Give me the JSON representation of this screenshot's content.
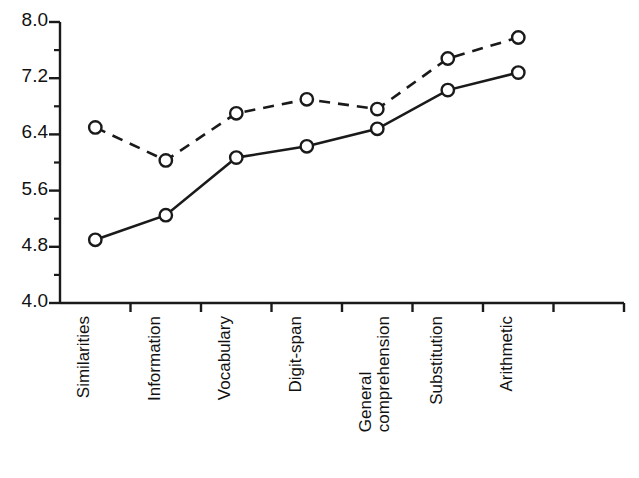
{
  "chart_data": {
    "type": "line",
    "title": "",
    "xlabel": "",
    "ylabel": "",
    "categories": [
      "Similarities",
      "Information",
      "Vocabulary",
      "Digit-span",
      "General\ncomprehension",
      "Substitution",
      "Arithmetic"
    ],
    "series": [
      {
        "name": "dashed-series",
        "style": "dashed",
        "marker": "open-circle",
        "values": [
          6.5,
          6.03,
          6.7,
          6.9,
          6.76,
          7.48,
          7.78
        ]
      },
      {
        "name": "solid-series",
        "style": "solid",
        "marker": "open-circle",
        "values": [
          4.9,
          5.25,
          6.07,
          6.23,
          6.48,
          7.03,
          7.28
        ]
      }
    ],
    "y_major_ticks": [
      "4.0",
      "4.8",
      "5.6",
      "6.4",
      "7.2",
      "8.0"
    ],
    "y_major_values": [
      4.0,
      4.8,
      5.6,
      6.4,
      7.2,
      8.0
    ],
    "y_minor_values": [
      4.4,
      5.2,
      6.0,
      6.8,
      7.6
    ],
    "ylim": [
      4.0,
      8.0
    ],
    "grid": false,
    "legend": "none",
    "line_color": "#1a1a1a",
    "marker_fill": "#ffffff"
  }
}
